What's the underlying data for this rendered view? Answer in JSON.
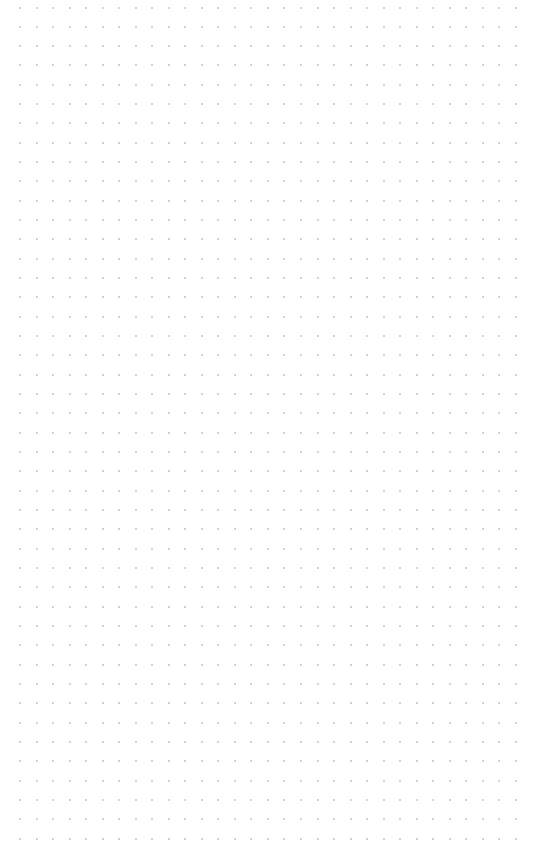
{
  "canvas": {
    "background_color": "#ffffff",
    "pattern": "dot-grid",
    "dot_color": "#c4c4c4",
    "dot_size_px": 2,
    "columns": 31,
    "rows": 44,
    "origin_x": 20,
    "origin_y": 7.5,
    "spacing_x": 16.53,
    "spacing_y": 19.33
  }
}
